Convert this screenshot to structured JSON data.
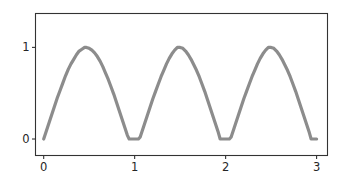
{
  "chart_data": {
    "type": "line",
    "title": "",
    "subtitle": "",
    "xlabel": "",
    "ylabel": "",
    "xlim": [
      -0.09,
      3.12
    ],
    "ylim": [
      -0.18,
      1.37
    ],
    "xticks": [
      0,
      1,
      2,
      3
    ],
    "xticklabels": [
      "0",
      "1",
      "2",
      "3"
    ],
    "yticks": [
      0,
      1
    ],
    "yticklabels": [
      "0",
      "1"
    ],
    "grid": false,
    "legend": null,
    "legend_position": "none",
    "annotations": [],
    "series": [
      {
        "name": "rectified sine",
        "color": "#8c8c8c",
        "linewidth": 3.2,
        "description": "clipped rectified sine, period 1.0, peak value 1, flat zero troughs",
        "x": [
          0.0,
          0.03,
          0.06,
          0.09,
          0.12,
          0.15,
          0.18,
          0.21,
          0.24,
          0.27,
          0.3,
          0.33,
          0.36,
          0.39,
          0.42,
          0.45,
          0.47,
          0.5,
          0.53,
          0.56,
          0.59,
          0.62,
          0.65,
          0.68,
          0.71,
          0.74,
          0.77,
          0.8,
          0.83,
          0.86,
          0.89,
          0.92,
          0.94,
          0.96,
          1.0,
          1.04,
          1.06,
          1.08,
          1.11,
          1.14,
          1.17,
          1.2,
          1.23,
          1.26,
          1.29,
          1.32,
          1.35,
          1.38,
          1.41,
          1.44,
          1.47,
          1.5,
          1.53,
          1.56,
          1.59,
          1.62,
          1.65,
          1.68,
          1.71,
          1.74,
          1.77,
          1.8,
          1.83,
          1.86,
          1.89,
          1.92,
          1.94,
          1.96,
          2.0,
          2.04,
          2.06,
          2.08,
          2.11,
          2.14,
          2.17,
          2.2,
          2.23,
          2.26,
          2.29,
          2.32,
          2.35,
          2.38,
          2.41,
          2.44,
          2.47,
          2.5,
          2.53,
          2.56,
          2.59,
          2.62,
          2.65,
          2.68,
          2.71,
          2.74,
          2.77,
          2.8,
          2.83,
          2.86,
          2.89,
          2.92,
          2.94,
          2.96,
          3.0
        ],
        "y": [
          0.0,
          0.09,
          0.18,
          0.27,
          0.36,
          0.45,
          0.53,
          0.61,
          0.69,
          0.76,
          0.82,
          0.87,
          0.92,
          0.96,
          0.98,
          1.0,
          1.0,
          0.99,
          0.97,
          0.94,
          0.9,
          0.85,
          0.79,
          0.72,
          0.65,
          0.57,
          0.49,
          0.4,
          0.31,
          0.22,
          0.13,
          0.04,
          0.0,
          0.0,
          0.0,
          0.0,
          0.02,
          0.08,
          0.17,
          0.26,
          0.35,
          0.44,
          0.52,
          0.6,
          0.68,
          0.75,
          0.82,
          0.88,
          0.93,
          0.97,
          1.0,
          1.0,
          0.99,
          0.96,
          0.92,
          0.87,
          0.81,
          0.75,
          0.68,
          0.6,
          0.52,
          0.43,
          0.34,
          0.25,
          0.16,
          0.07,
          0.0,
          0.0,
          0.0,
          0.0,
          0.02,
          0.08,
          0.17,
          0.26,
          0.35,
          0.44,
          0.52,
          0.6,
          0.68,
          0.75,
          0.82,
          0.88,
          0.93,
          0.97,
          1.0,
          1.0,
          0.99,
          0.96,
          0.92,
          0.87,
          0.81,
          0.75,
          0.68,
          0.6,
          0.52,
          0.43,
          0.34,
          0.25,
          0.16,
          0.07,
          0.0,
          0.0,
          0.0
        ]
      }
    ]
  },
  "axes": {
    "spine_color": "#333333",
    "background": "#ffffff",
    "tick_label_color": "#262626"
  }
}
